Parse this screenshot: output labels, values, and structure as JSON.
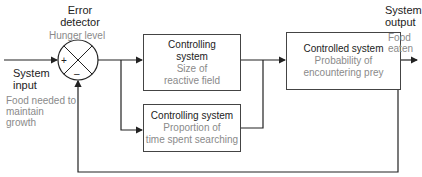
{
  "diagram": {
    "type": "feedback-control-block-diagram",
    "error_detector": {
      "title_line1": "Error",
      "title_line2": "detector",
      "subtitle": "Hunger level",
      "plus_sign": "+",
      "minus_sign": "–"
    },
    "system_input": {
      "title_line1": "System",
      "title_line2": "input",
      "desc_line1": "Food needed to",
      "desc_line2": "maintain",
      "desc_line3": "growth"
    },
    "controlling_system_1": {
      "title_line1": "Controlling",
      "title_line2": "system",
      "desc_line1": "Size of",
      "desc_line2": "reactive field"
    },
    "controlling_system_2": {
      "title": "Controlling system",
      "desc_line1": "Proportion of",
      "desc_line2": "time spent searching"
    },
    "controlled_system": {
      "title": "Controlled system",
      "desc_line1": "Probability of",
      "desc_line2": "encountering prey"
    },
    "system_output": {
      "title_line1": "System",
      "title_line2": "output",
      "desc_line1": "Food",
      "desc_line2": "eaten"
    },
    "colors": {
      "line": "#222222",
      "box_border": "#444444",
      "grey_text": "#8a8a8a"
    }
  }
}
